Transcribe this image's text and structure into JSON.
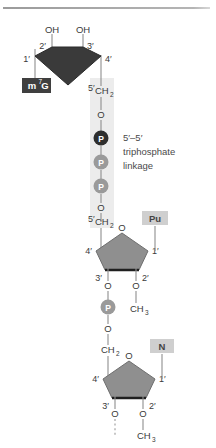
{
  "figure": {
    "annotation": {
      "line1": "5′–5′",
      "line2": "triphosphate",
      "line3": "linkage"
    },
    "colors": {
      "cap_box": "#3f3f3f",
      "cap_sugar": "#3a3a3a",
      "mid_sugar": "#8f8f8f",
      "low_sugar": "#8f8f8f",
      "phosphate_dark": "#2e2e2e",
      "phosphate_light": "#9a9a9a",
      "base_box": "#cfcfcf",
      "highlight_band": "#ececec",
      "bond_line": "#8e8e8e",
      "text": "#3a3a3a"
    },
    "cap_unit": {
      "base_label": "m",
      "base_superscript": "7",
      "base_label_tail": "G",
      "hydroxyl_left": "OH",
      "hydroxyl_right": "OH",
      "carbon_1": "1′",
      "carbon_2": "2′",
      "carbon_3": "3′",
      "carbon_4": "4′",
      "carbon_5": "5′",
      "ch2": "CH",
      "ch2_sub": "2"
    },
    "triphosphate": {
      "oxygen_top": "O",
      "p1": "P",
      "p2": "P",
      "p3": "P",
      "oxygen_bottom": "O"
    },
    "middle_unit": {
      "carbon_5": "5′",
      "ch2": "CH",
      "ch2_sub": "2",
      "ring_oxygen": "O",
      "base_label": "Pu",
      "carbon_1": "1′",
      "carbon_2": "2′",
      "carbon_3": "3′",
      "carbon_4": "4′",
      "o3": "O",
      "o2": "O",
      "methyl": "CH",
      "methyl_sub": "3",
      "phosphate": "P",
      "phosphate_o_top": "O",
      "phosphate_o_bottom": "O"
    },
    "lower_unit": {
      "ch2": "CH",
      "ch2_sub": "2",
      "ring_oxygen": "O",
      "base_label": "N",
      "carbon_1": "1′",
      "carbon_2": "2′",
      "carbon_3": "3′",
      "carbon_4": "4′",
      "o3": "O",
      "o2": "O",
      "methyl": "CH",
      "methyl_sub": "3"
    }
  }
}
